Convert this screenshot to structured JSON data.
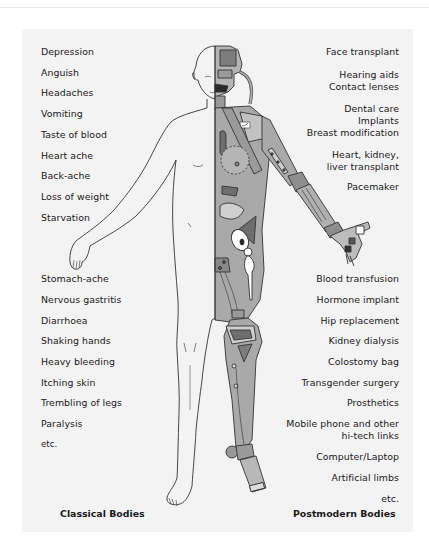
{
  "classical": {
    "caption": "Classical Bodies",
    "items_upper": [
      "Depression",
      "Anguish",
      "Headaches",
      "Vomiting",
      "Taste of blood",
      "Heart ache",
      "Back-ache",
      "Loss of weight",
      "Starvation"
    ],
    "items_lower": [
      "Stomach-ache",
      "Nervous gastritis",
      "Diarrhoea",
      "Shaking hands",
      "Heavy bleeding",
      "Itching skin",
      "Trembling of legs",
      "Paralysis",
      "etc."
    ]
  },
  "postmodern": {
    "caption": "Postmodern Bodies",
    "items_upper": [
      [
        "Face transplant"
      ],
      [
        "Hearing aids",
        "Contact lenses"
      ],
      [
        "Dental care",
        "Implants",
        "Breast modification"
      ],
      [
        "Heart, kidney,",
        "liver transplant"
      ],
      [
        "Pacemaker"
      ]
    ],
    "items_lower": [
      [
        "Blood transfusion"
      ],
      [
        "Hormone implant"
      ],
      [
        "Hip replacement"
      ],
      [
        "Kidney dialysis"
      ],
      [
        "Colostomy bag"
      ],
      [
        "Transgender surgery"
      ],
      [
        "Prosthetics"
      ],
      [
        "Mobile phone and other",
        "hi-tech links"
      ],
      [
        "Computer/Laptop"
      ],
      [
        "Artificial limbs"
      ],
      [
        "etc."
      ]
    ]
  },
  "colors": {
    "background": "#ffffff",
    "panel": "#f3f3f3",
    "text": "#1a1a1a",
    "metal": "#a9a9a9",
    "metal_dark": "#7d7d7d",
    "outline": "#333333"
  }
}
